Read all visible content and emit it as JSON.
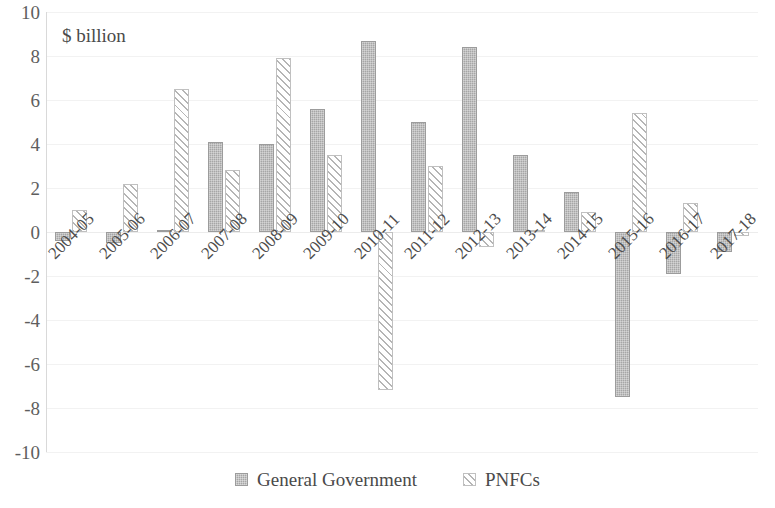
{
  "chart_data": {
    "type": "bar",
    "title": "$ billion",
    "xlabel": "",
    "ylabel": "",
    "ylim": [
      -10,
      10
    ],
    "yticks": [
      10,
      8,
      6,
      4,
      2,
      0,
      -2,
      -4,
      -6,
      -8,
      -10
    ],
    "ytick_labels": [
      "10",
      "8",
      "6",
      "4",
      "2",
      "0",
      "-2",
      "-4",
      "-6",
      "-8",
      "-10"
    ],
    "grid": true,
    "legend_position": "bottom",
    "categories": [
      "2004-05",
      "2005-06",
      "2006-07",
      "2007-08",
      "2008-09",
      "2009-10",
      "2010-11",
      "2011-12",
      "2012-13",
      "2013-14",
      "2014-15",
      "2015-16",
      "2016-17",
      "2017-18"
    ],
    "series": [
      {
        "name": "General Government",
        "pattern": "solid-dotted-gray",
        "color": "#a6a6a6",
        "values": [
          -0.4,
          -0.5,
          0.1,
          4.1,
          4.0,
          5.6,
          8.7,
          5.0,
          8.4,
          3.5,
          1.8,
          -7.5,
          -1.9,
          -0.9
        ]
      },
      {
        "name": "PNFCs",
        "pattern": "diagonal-hatch",
        "color": "#b5b5b5",
        "values": [
          1.0,
          2.2,
          6.5,
          2.8,
          7.9,
          3.5,
          -7.2,
          3.0,
          -0.7,
          0.1,
          0.9,
          5.4,
          1.3,
          -0.2
        ]
      }
    ]
  },
  "legend": {
    "items": [
      {
        "label": "General Government",
        "swatch": "gg"
      },
      {
        "label": "PNFCs",
        "swatch": "pnfc"
      }
    ]
  }
}
